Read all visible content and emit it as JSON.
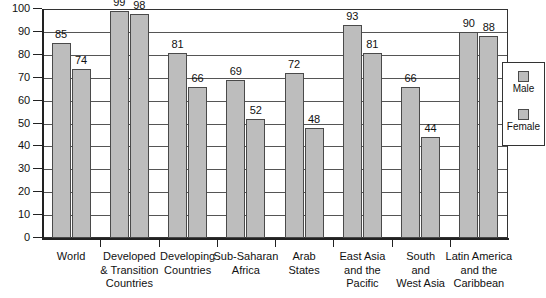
{
  "chart_data": {
    "type": "bar",
    "title": "",
    "subtitle": "",
    "xlabel": "",
    "ylabel": "",
    "ylim": [
      0,
      100
    ],
    "ytick_labels": [
      "0",
      "10",
      "20",
      "30",
      "40",
      "50",
      "60",
      "70",
      "80",
      "90",
      "100"
    ],
    "ytick_values": [
      0,
      10,
      20,
      30,
      40,
      50,
      60,
      70,
      80,
      90,
      100
    ],
    "grid": "horizontal",
    "legend_position": "right-inside",
    "categories": [
      "World",
      "Developed & Transition Countries",
      "Developing Countries",
      "Sub-Saharan Africa",
      "Arab States",
      "East Asia and the Pacific",
      "South and West Asia",
      "Latin America and the Caribbean"
    ],
    "category_lines": [
      [
        "World"
      ],
      [
        "Developed",
        "& Transition",
        "Countries"
      ],
      [
        "Developing",
        "Countries"
      ],
      [
        "Sub-Saharan",
        "Africa"
      ],
      [
        "Arab",
        "States"
      ],
      [
        "East Asia",
        "and the",
        "Pacific"
      ],
      [
        "South",
        "and",
        "West Asia"
      ],
      [
        "Latin America",
        "and the",
        "Caribbean"
      ]
    ],
    "series": [
      {
        "name": "Male",
        "values": [
          85,
          99,
          81,
          69,
          72,
          93,
          66,
          90
        ],
        "color": "#bdbdbd"
      },
      {
        "name": "Female",
        "values": [
          74,
          98,
          66,
          52,
          48,
          81,
          44,
          88
        ],
        "color": "#bdbdbd"
      }
    ]
  },
  "legend": {
    "entries": [
      {
        "label": "Male"
      },
      {
        "label": "Female"
      }
    ]
  },
  "colors": {
    "bar_fill": "#bdbdbd",
    "bar_stroke": "#4a4a4a",
    "grid": "#555555",
    "axis": "#222222",
    "background": "#ffffff"
  }
}
